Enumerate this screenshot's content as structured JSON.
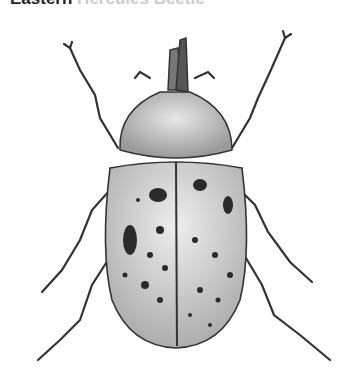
{
  "caption": {
    "title_bold": "Eastern",
    "title_rest": " Hercules Beetle"
  },
  "illustration": {
    "subject": "beetle",
    "style": "grayscale engraving",
    "colors": {
      "shell": "#cfcfcf",
      "shell_shadow": "#9a9a9a",
      "spots": "#2a2a2a",
      "outline": "#333333"
    }
  }
}
